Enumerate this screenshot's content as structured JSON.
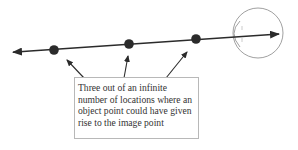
{
  "diagram": {
    "label": "Three out of an infinite number of locations where an object point could have given rise to the image point",
    "colors": {
      "line": "#2b2b2b",
      "eye": "#888888",
      "box_border": "#b8b8b8",
      "text": "#333333"
    },
    "points": [
      {
        "name": "object-point-1",
        "x": 54,
        "y": 50
      },
      {
        "name": "object-point-2",
        "x": 129,
        "y": 43
      },
      {
        "name": "object-point-3",
        "x": 196,
        "y": 39
      }
    ]
  }
}
